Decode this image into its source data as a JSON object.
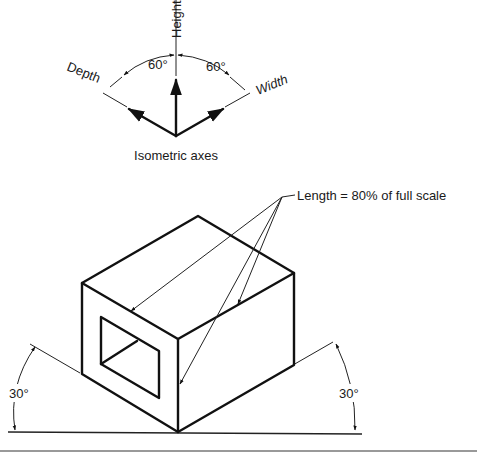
{
  "diagram": {
    "type": "isometric drawing illustration",
    "axes_figure": {
      "caption": "Isometric axes",
      "axis_labels": {
        "height": "Height",
        "depth": "Depth",
        "width": "Width"
      },
      "angle_labels": [
        "60°",
        "60°"
      ]
    },
    "box_figure": {
      "callout": "Length = 80% of full scale",
      "angle_labels": [
        "30°",
        "30°"
      ]
    },
    "colors": {
      "line": "#111111",
      "background": "#ffffff"
    }
  }
}
